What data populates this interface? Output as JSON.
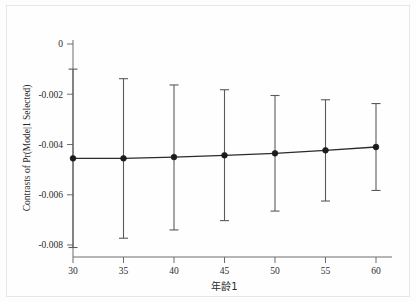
{
  "chart_data": {
    "type": "line",
    "title": "",
    "subtitle": "",
    "xlabel": "年龄1",
    "ylabel": "Contrasts of Pr(Mode|1 Selected)",
    "x": [
      30,
      35,
      40,
      45,
      50,
      55,
      60
    ],
    "xtick_labels": [
      "30",
      "35",
      "40",
      "45",
      "50",
      "55",
      "60"
    ],
    "ytick_labels": [
      "0",
      "-0.002",
      "-0.004",
      "-0.006",
      "-0.008"
    ],
    "ytick_values": [
      0,
      -0.002,
      -0.004,
      -0.006,
      -0.008
    ],
    "xlim": [
      30,
      60
    ],
    "ylim": [
      -0.0086,
      0.0002
    ],
    "grid": false,
    "legend": "none",
    "series": [
      {
        "name": "Contrasts of Pr(Mode|1 Selected)",
        "marker": "filled-circle",
        "color": "#1b1b1b",
        "values": [
          -0.00455,
          -0.00455,
          -0.0045,
          -0.00443,
          -0.00435,
          -0.00423,
          -0.0041
        ],
        "ci_lower": [
          -0.0081,
          -0.00773,
          -0.0074,
          -0.00703,
          -0.00665,
          -0.00625,
          -0.00583
        ],
        "ci_upper": [
          -0.001,
          -0.00138,
          -0.00163,
          -0.00182,
          -0.00205,
          -0.00222,
          -0.00237
        ]
      }
    ],
    "annotations": []
  },
  "axes": {
    "y_title": "Contrasts of Pr(Mode|1 Selected)",
    "x_title": "年龄1"
  }
}
